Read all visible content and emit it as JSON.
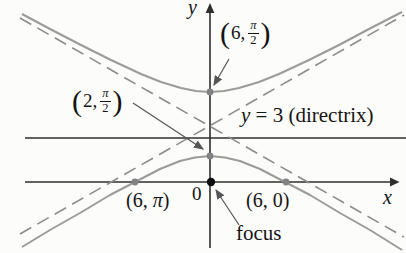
{
  "diagram": {
    "axis": {
      "x": "x",
      "y": "y",
      "origin": "0"
    },
    "directrix_label": {
      "var": "y",
      "rest": " = 3 (directrix)"
    },
    "labels": {
      "upper_vertex": {
        "open": "(",
        "value": "6,",
        "num": "π",
        "den": "2",
        "close": ")"
      },
      "lower_vertex": {
        "open": "(",
        "value": "2,",
        "num": "π",
        "den": "2",
        "close": ")"
      },
      "left_intercept": {
        "pre": "(6, ",
        "var": "π",
        "post": ")"
      },
      "right_intercept": "(6, 0)",
      "focus": "focus"
    },
    "colors": {
      "background": "#fcfcfa",
      "axis": "#2f2f2f",
      "curve": "#9b9b9b",
      "asymptote": "#8c8c8c",
      "point_dot": "#838383",
      "focus_dot": "#0d0d0d",
      "annotation_arrow": "#555555",
      "text": "#141414"
    }
  }
}
